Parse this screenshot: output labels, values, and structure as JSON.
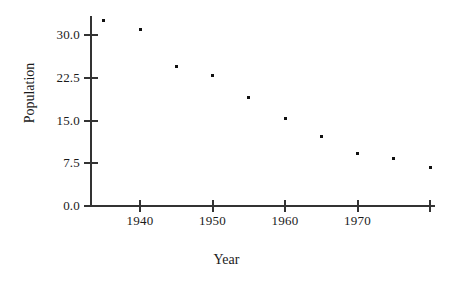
{
  "chart_data": {
    "type": "scatter",
    "title": "",
    "xlabel": "Year",
    "ylabel": "Population",
    "x": [
      1935,
      1940,
      1945,
      1950,
      1955,
      1960,
      1965,
      1970,
      1975,
      1980
    ],
    "values": [
      32.6,
      31.0,
      24.5,
      22.9,
      19.0,
      15.4,
      12.2,
      9.2,
      8.4,
      6.8
    ],
    "series": [
      {
        "name": "Population",
        "points": [
          {
            "x": 1935,
            "y": 32.6
          },
          {
            "x": 1940,
            "y": 31.0
          },
          {
            "x": 1945,
            "y": 24.5
          },
          {
            "x": 1950,
            "y": 22.9
          },
          {
            "x": 1955,
            "y": 19.0
          },
          {
            "x": 1960,
            "y": 15.4
          },
          {
            "x": 1965,
            "y": 12.2
          },
          {
            "x": 1970,
            "y": 9.2
          },
          {
            "x": 1975,
            "y": 8.4
          },
          {
            "x": 1980,
            "y": 6.8
          }
        ]
      }
    ],
    "xlim": [
      1933,
      1980.8
    ],
    "ylim": [
      0.0,
      33.5
    ],
    "xticks": [
      1940,
      1950,
      1960,
      1970,
      1980
    ],
    "xticklabels": [
      "1940",
      "1950",
      "1960",
      "1970",
      ""
    ],
    "yticks": [
      0.0,
      7.5,
      15.0,
      22.5,
      30.0
    ],
    "yticklabels": [
      "0.0",
      "7.5",
      "15.0",
      "22.5",
      "30.0"
    ],
    "grid": false,
    "legend": null,
    "marker": "square",
    "marker_color": "#111111",
    "axis_color": "#333333"
  }
}
